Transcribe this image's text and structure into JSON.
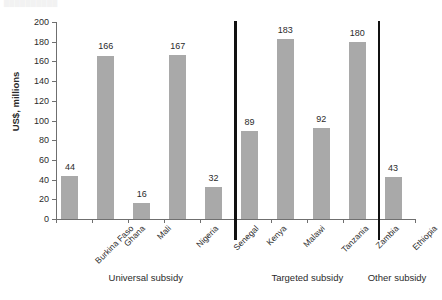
{
  "figure": {
    "title_remnant": "██████████",
    "y_axis_title": "US$, millions"
  },
  "chart_data": {
    "type": "bar",
    "title": "",
    "xlabel": "",
    "ylabel": "US$, millions",
    "ylim": [
      0,
      200
    ],
    "yticks": [
      0,
      20,
      40,
      60,
      80,
      100,
      120,
      140,
      160,
      180,
      200
    ],
    "grid": false,
    "legend": "none",
    "bar_color": "#a9a9a9",
    "divider_color": "#111111",
    "categories": [
      "Burkina Faso",
      "Ghana",
      "Mali",
      "Nigeria",
      "Senegal",
      "Kenya",
      "Malawi",
      "Tanzania",
      "Zambia",
      "Ethiopia"
    ],
    "values": [
      44,
      166,
      16,
      167,
      32,
      89,
      183,
      92,
      180,
      43
    ],
    "data_labels": [
      "44",
      "166",
      "16",
      "167",
      "32",
      "89",
      "183",
      "92",
      "180",
      "43"
    ],
    "groups": [
      {
        "label": "Universal subsidy",
        "categories": [
          "Burkina Faso",
          "Ghana",
          "Mali",
          "Nigeria",
          "Senegal"
        ]
      },
      {
        "label": "Targeted subsidy",
        "categories": [
          "Kenya",
          "Malawi",
          "Tanzania",
          "Zambia"
        ]
      },
      {
        "label": "Other subsidy",
        "categories": [
          "Ethiopia"
        ]
      }
    ],
    "group_labels": [
      "Universal subsidy",
      "Targeted subsidy",
      "Other subsidy"
    ],
    "annotations": [
      "Thick vertical rule between Senegal and Kenya",
      "Thick vertical rule between Zambia and Ethiopia"
    ]
  }
}
